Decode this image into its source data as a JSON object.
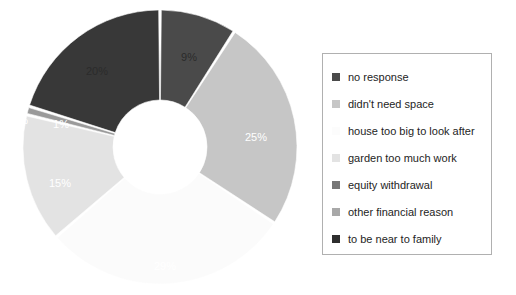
{
  "chart_data": {
    "type": "pie",
    "variant": "donut",
    "title": "",
    "subtitle": "",
    "xlabel": "",
    "ylabel": "",
    "legend_position": "right",
    "grid": false,
    "categories": [
      "no response",
      "didn't need space",
      "house too big to look after",
      "garden too much work",
      "equity withdrawal",
      "other financial reason",
      "to be near to family"
    ],
    "values": [
      9,
      25,
      29,
      15,
      1,
      0,
      20
    ],
    "data_labels": [
      "9%",
      "25%",
      "29%",
      "15%",
      "1%",
      "0%",
      "20%"
    ],
    "colors": [
      "#4a4a4a",
      "#c6c6c6",
      "#fbfbfb",
      "#e3e3e3",
      "#9a9a9a",
      "#d2d2d2",
      "#383838"
    ],
    "slices": [
      {
        "label": "no response",
        "value": 9,
        "data_label": "9%",
        "color": "#4a4a4a",
        "label_color": "light"
      },
      {
        "label": "didn't need space",
        "value": 25,
        "data_label": "25%",
        "color": "#c6c6c6",
        "label_color": "dark"
      },
      {
        "label": "house too big to look after",
        "value": 29,
        "data_label": "29%",
        "color": "#fbfbfb",
        "label_color": "dark"
      },
      {
        "label": "garden too much work",
        "value": 15,
        "data_label": "15%",
        "color": "#e3e3e3",
        "label_color": "dark"
      },
      {
        "label": "equity withdrawal",
        "value": 1,
        "data_label": "1%",
        "color": "#9a9a9a",
        "label_color": "dark"
      },
      {
        "label": "other financial reason",
        "value": 0,
        "data_label": "0%",
        "color": "#d2d2d2",
        "label_color": "dark"
      },
      {
        "label": "to be near to family",
        "value": 20,
        "data_label": "20%",
        "color": "#383838",
        "label_color": "light"
      }
    ]
  },
  "legend": {
    "items": [
      {
        "label": "no response",
        "color": "#4a4a4a"
      },
      {
        "label": "didn't need space",
        "color": "#c6c6c6"
      },
      {
        "label": "house too big to look after",
        "color": "#fcfcfc"
      },
      {
        "label": "garden too much work",
        "color": "#e3e3e3"
      },
      {
        "label": "equity withdrawal",
        "color": "#777777"
      },
      {
        "label": "other financial reason",
        "color": "#a8a8a8"
      },
      {
        "label": "to be near to family",
        "color": "#2e2e2e"
      }
    ]
  },
  "label_positions": [
    {
      "data_label": "9%",
      "x": 189,
      "y": 57,
      "tone": "light-bg"
    },
    {
      "data_label": "25%",
      "x": 256,
      "y": 137,
      "tone": "dark-bg"
    },
    {
      "data_label": "29%",
      "x": 165,
      "y": 266,
      "tone": "dark-bg"
    },
    {
      "data_label": "15%",
      "x": 60,
      "y": 183,
      "tone": "dark-bg"
    },
    {
      "data_label": "1%",
      "x": 61,
      "y": 124,
      "tone": "dark-bg"
    },
    {
      "data_label": "0%",
      "x": 20,
      "y": 120,
      "tone": "dark-bg"
    },
    {
      "data_label": "20%",
      "x": 97,
      "y": 71,
      "tone": "light-bg"
    }
  ]
}
